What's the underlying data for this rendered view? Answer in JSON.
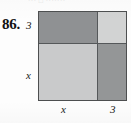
{
  "problem": {
    "number_label": "86.",
    "artifact_text": "··· □ ·······"
  },
  "figure": {
    "type": "partitioned-square-area-model",
    "labels": {
      "left_top": "3",
      "left_bottom": "x",
      "bottom_left": "x",
      "bottom_right": "3"
    },
    "regions": [
      {
        "name": "top-left",
        "width_label": "x",
        "height_label": "3",
        "fill": "#8f9193"
      },
      {
        "name": "top-right",
        "width_label": "3",
        "height_label": "3",
        "fill": "#d2d3d3"
      },
      {
        "name": "bottom-left",
        "width_label": "x",
        "height_label": "x",
        "fill": "#c9cacb"
      },
      {
        "name": "bottom-right",
        "width_label": "3",
        "height_label": "x",
        "fill": "#949697"
      }
    ],
    "border_color": "#4d4f50",
    "divider_color": "#55585a"
  }
}
